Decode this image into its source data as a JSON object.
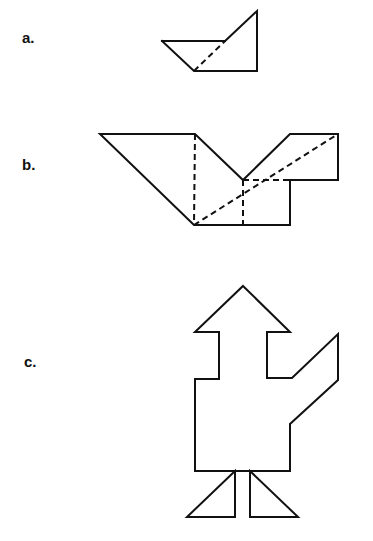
{
  "figures": [
    {
      "id": "a",
      "label": "a.",
      "solid_paths": [
        "M162,41 L225,41",
        "M162,41 L194,71 L257,71 L257,11 L225,41"
      ],
      "dashed_paths": [
        "M194,71 L225,41"
      ]
    },
    {
      "id": "b",
      "label": "b.",
      "solid_paths": [
        "M100,134 L195,134 L243,180 L290,134 L338,134 L338,180 L290,180 L290,225 L194,225 Z"
      ],
      "dashed_paths": [
        "M195,134 L194,225",
        "M194,225 L338,134",
        "M243,180 L290,180",
        "M243,180 L243,225"
      ]
    },
    {
      "id": "c",
      "label": "c.",
      "solid_paths": [
        "M243,286 L290,332 L267,332 L267,378 L292,378 L338,334 L338,380 L290,424 L290,471 L195,471 L195,379 L219,379 L219,332 L195,332 Z",
        "M235,471 L187,517 L235,517 Z",
        "M250,471 L250,517 L298,517 Z"
      ],
      "dashed_paths": []
    }
  ],
  "colors": {
    "stroke": "#111111",
    "background": "#ffffff"
  }
}
